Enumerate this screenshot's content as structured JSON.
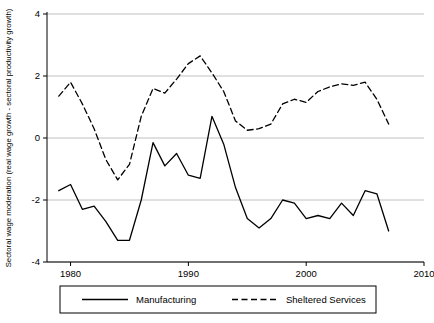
{
  "chart_data": {
    "type": "line",
    "title": "",
    "xlabel": "",
    "ylabel": "Sectoral wage moderation (real wage growth - sectoral productivity growth)",
    "xlim": [
      1978,
      2010
    ],
    "ylim": [
      -4,
      4
    ],
    "xticks": [
      1980,
      1990,
      2000,
      2010
    ],
    "yticks": [
      -4,
      -2,
      0,
      2,
      4
    ],
    "grid": "horizontal",
    "legend_position": "bottom",
    "series": [
      {
        "name": "Manufacturing",
        "style": "solid",
        "color": "#000000",
        "x": [
          1979,
          1980,
          1981,
          1982,
          1983,
          1984,
          1985,
          1986,
          1987,
          1988,
          1989,
          1990,
          1991,
          1992,
          1993,
          1994,
          1995,
          1996,
          1997,
          1998,
          1999,
          2000,
          2001,
          2002,
          2003,
          2004,
          2005,
          2006,
          2007
        ],
        "values": [
          -1.7,
          -1.5,
          -2.3,
          -2.2,
          -2.7,
          -3.3,
          -3.3,
          -2.0,
          -0.15,
          -0.9,
          -0.5,
          -1.2,
          -1.3,
          0.7,
          -0.2,
          -1.6,
          -2.6,
          -2.9,
          -2.6,
          -2.0,
          -2.1,
          -2.6,
          -2.5,
          -2.6,
          -2.1,
          -2.5,
          -1.7,
          -1.8,
          -3.0
        ]
      },
      {
        "name": "Sheltered Services",
        "style": "dashed",
        "color": "#000000",
        "x": [
          1979,
          1980,
          1981,
          1982,
          1983,
          1984,
          1985,
          1986,
          1987,
          1988,
          1989,
          1990,
          1991,
          1992,
          1993,
          1994,
          1995,
          1996,
          1997,
          1998,
          1999,
          2000,
          2001,
          2002,
          2003,
          2004,
          2005,
          2006,
          2007
        ],
        "values": [
          1.35,
          1.8,
          1.1,
          0.3,
          -0.7,
          -1.35,
          -0.85,
          0.7,
          1.6,
          1.45,
          1.9,
          2.4,
          2.65,
          2.1,
          1.5,
          0.55,
          0.25,
          0.3,
          0.45,
          1.1,
          1.25,
          1.15,
          1.5,
          1.65,
          1.75,
          1.7,
          1.8,
          1.25,
          0.45
        ]
      }
    ],
    "legend": [
      {
        "label": "Manufacturing",
        "style": "solid"
      },
      {
        "label": "Sheltered Services",
        "style": "dashed"
      }
    ]
  }
}
